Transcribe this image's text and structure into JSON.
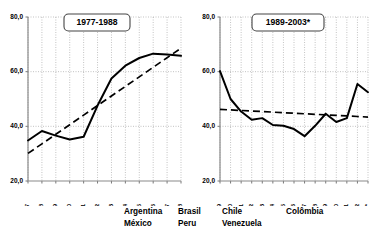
{
  "chart_data": [
    {
      "type": "line",
      "title": "1977-1988",
      "xlabel": "",
      "ylabel": "",
      "ylim": [
        20.0,
        80.0
      ],
      "yticks": [
        20.0,
        40.0,
        60.0,
        80.0
      ],
      "ytick_labels": [
        "20,0",
        "40,0",
        "60,0",
        "80,0"
      ],
      "grid": true,
      "legend_position": "bottom",
      "categories": [
        "1977",
        "1978",
        "1979",
        "1980",
        "1981",
        "1982",
        "1983",
        "1984",
        "1985",
        "1986",
        "1987",
        "1988"
      ],
      "series": [
        {
          "name": "observed",
          "style": "solid",
          "values": [
            34.8,
            38.3,
            36.6,
            35.2,
            36.2,
            47.6,
            57.5,
            62.2,
            65.0,
            66.6,
            66.3,
            65.8
          ]
        },
        {
          "name": "trend",
          "style": "dashed",
          "values": [
            30.1,
            33.6,
            37.1,
            40.6,
            44.1,
            47.6,
            51.1,
            54.6,
            58.1,
            61.6,
            65.1,
            68.6
          ]
        }
      ]
    },
    {
      "type": "line",
      "title": "1989-2003*",
      "xlabel": "",
      "ylabel": "",
      "ylim": [
        20.0,
        80.0
      ],
      "yticks": [
        20.0,
        40.0,
        60.0,
        80.0
      ],
      "ytick_labels": [
        "20,0",
        "40,0",
        "60,0",
        "80,0"
      ],
      "grid": true,
      "legend_position": "bottom",
      "categories": [
        "1989",
        "1990",
        "1991",
        "1992",
        "1993",
        "1994",
        "1995",
        "1996",
        "1997",
        "1998",
        "1999",
        "2000",
        "2001",
        "2002",
        "2003*"
      ],
      "series": [
        {
          "name": "observed",
          "style": "solid",
          "values": [
            60.2,
            50.0,
            45.4,
            42.4,
            43.0,
            40.5,
            40.2,
            39.0,
            36.4,
            40.2,
            44.6,
            41.6,
            43.0,
            55.5,
            52.5
          ]
        },
        {
          "name": "trend",
          "style": "dashed",
          "values": [
            46.2,
            46.0,
            45.8,
            45.6,
            45.4,
            45.2,
            45.0,
            44.8,
            44.6,
            44.4,
            44.2,
            44.0,
            43.8,
            43.6,
            43.4
          ]
        }
      ]
    }
  ],
  "legend": {
    "columns": [
      {
        "line1": "Argentina",
        "line2": "México"
      },
      {
        "line1": "Brasil",
        "line2": "Peru"
      },
      {
        "line1": "Chile",
        "line2": "Venezuela"
      },
      {
        "line1": "Colômbia",
        "line2": ""
      }
    ]
  }
}
